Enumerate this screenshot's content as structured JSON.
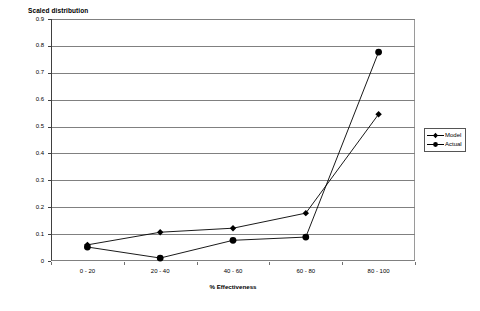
{
  "chart_data": {
    "type": "line",
    "title": "Scaled distribution",
    "xlabel": "% Effectiveness",
    "ylabel": "",
    "categories": [
      "0 - 20",
      "20 - 40",
      "40 - 60",
      "60 - 80",
      "80 - 100"
    ],
    "series": [
      {
        "name": "Model",
        "marker": "diamond",
        "values": [
          0.06,
          0.107,
          0.122,
          0.178,
          0.546
        ]
      },
      {
        "name": "Actual",
        "marker": "circle",
        "values": [
          0.052,
          0.011,
          0.077,
          0.089,
          0.777
        ]
      }
    ],
    "ylim": [
      0,
      0.9
    ],
    "ytick_labels": [
      "0.9",
      "0.8",
      "0.7",
      "0.6",
      "0.5",
      "0.4",
      "0.3",
      "0.2",
      "0.1",
      "0"
    ],
    "ytick_values": [
      0.9,
      0.8,
      0.7,
      0.6,
      0.5,
      0.4,
      0.3,
      0.2,
      0.1,
      0
    ],
    "grid": "horizontal",
    "legend_position": "right",
    "colors": {
      "line": "#000000",
      "grid": "#808080",
      "axis": "#404040"
    }
  },
  "legend": {
    "items": [
      {
        "label": "Model"
      },
      {
        "label": "Actual"
      }
    ]
  }
}
